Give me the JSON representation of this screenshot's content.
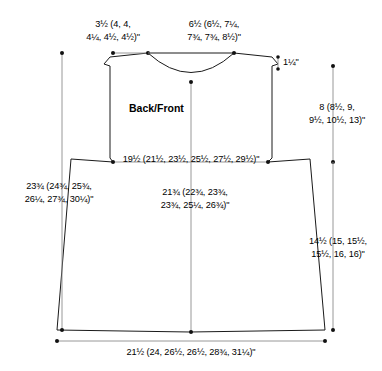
{
  "diagram": {
    "piece_label": "Back/Front",
    "units": "inches",
    "line_color": "#1a1a1a",
    "dimension_line_color": "#8c8c8c",
    "text_color": "#000000",
    "background": "#ffffff"
  },
  "measurements": {
    "shoulder_width": "3½ (4, 4,\n4¼, 4½, 4½)\"",
    "neck_width": "6½ (6½, 7¼,\n7¾, 7¾, 8½)\"",
    "neck_depth": "1¼\"",
    "armhole_depth": "8 (8½, 9,\n9½, 10½, 13)\"",
    "chest_width": "19½ (21½, 23½, 25½, 27½, 29½)\"",
    "total_length": "23¾ (24¾, 25¾,\n26¼, 27¾, 30¼)\"",
    "body_width_center": "21¾ (22¾, 23¾,\n23¾, 25¼, 26¾)\"",
    "side_length": "14½ (15, 15½,\n15½, 16, 16)\"",
    "hem_width": "21½ (24, 26½, 26½, 28¾, 31¼)\""
  }
}
